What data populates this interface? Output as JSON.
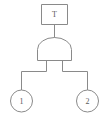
{
  "diagram": {
    "type": "fault-tree",
    "title": "",
    "colors": {
      "stroke": "#8a8a8a",
      "fill": "#ffffff",
      "text": "#5a5a5a",
      "background": "#ffffff"
    },
    "top_event": {
      "shape": "rectangle",
      "label": "T"
    },
    "gate": {
      "shape": "and-gate",
      "label": ""
    },
    "basic_events": [
      {
        "shape": "circle",
        "label": "1"
      },
      {
        "shape": "circle",
        "label": "2"
      }
    ]
  }
}
